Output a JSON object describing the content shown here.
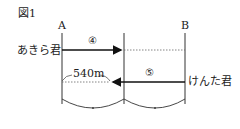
{
  "figure": {
    "title": "図1",
    "point_a": "A",
    "point_b": "B",
    "person_left": "あきら君",
    "person_right": "けんた君",
    "segment_left_ratio": "④",
    "segment_right_ratio": "⑤",
    "distance_label": "540m"
  }
}
